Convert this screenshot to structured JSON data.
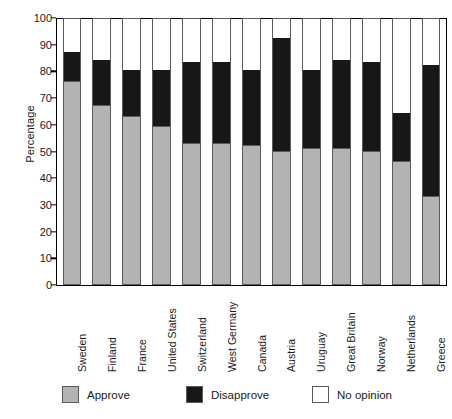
{
  "chart_data": {
    "type": "bar",
    "title": "",
    "subtitle": "",
    "xlabel": "",
    "ylabel": "Percentage",
    "ylim": [
      0,
      100
    ],
    "ytick_values": [
      0,
      10,
      20,
      30,
      40,
      50,
      60,
      70,
      80,
      90,
      100
    ],
    "ytick_labels": [
      "0",
      "10",
      "20",
      "30",
      "40",
      "50",
      "60",
      "70",
      "80",
      "90",
      "100"
    ],
    "grid": false,
    "stacked": true,
    "legend_position": "bottom",
    "categories": [
      "Sweden",
      "Finland",
      "France",
      "United States",
      "Switzerland",
      "West Germany",
      "Canada",
      "Austria",
      "Uruguay",
      "Great Britain",
      "Norway",
      "Netherlands",
      "Greece"
    ],
    "series": [
      {
        "name": "Approve",
        "color": "#b3b3b3",
        "values": [
          76,
          67,
          63,
          59,
          53,
          53,
          52,
          50,
          51,
          51,
          50,
          46,
          33
        ]
      },
      {
        "name": "Disapprove",
        "color": "#171717",
        "values": [
          11,
          17,
          17,
          21,
          30,
          30,
          28,
          42,
          29,
          33,
          33,
          18,
          49
        ]
      },
      {
        "name": "No opinion",
        "color": "#ffffff",
        "values": [
          13,
          16,
          20,
          20,
          17,
          17,
          20,
          8,
          20,
          16,
          17,
          36,
          18
        ]
      }
    ],
    "cumulative_tops": {
      "approve": [
        76,
        67,
        63,
        59,
        53,
        53,
        52,
        50,
        51,
        51,
        50,
        46,
        33
      ],
      "disapprove": [
        87,
        84,
        80,
        80,
        83,
        83,
        80,
        92,
        80,
        84,
        83,
        64,
        82
      ]
    }
  },
  "legend": {
    "items": [
      {
        "label": "Approve",
        "swatch": "approve-swatch",
        "color": "#b3b3b3"
      },
      {
        "label": "Disapprove",
        "swatch": "disapprove-swatch",
        "color": "#171717"
      },
      {
        "label": "No opinion",
        "swatch": "no-opinion-swatch",
        "color": "#ffffff"
      }
    ]
  }
}
